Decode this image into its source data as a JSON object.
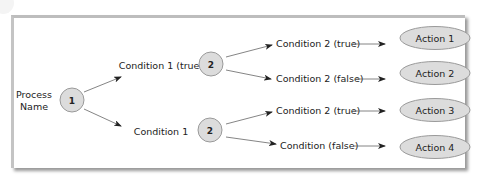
{
  "diagram": {
    "root": {
      "label_lines": [
        "Process",
        "Name"
      ],
      "step": "1"
    },
    "branches": [
      {
        "condition": "Condition 1 (true)",
        "step": "2",
        "outcomes": [
          {
            "condition": "Condition 2 (true)",
            "action": "Action 1"
          },
          {
            "condition": "Condition 2 (false)",
            "action": "Action 2"
          }
        ]
      },
      {
        "condition": "Condition 1",
        "step": "2",
        "outcomes": [
          {
            "condition": "Condition 2 (true)",
            "action": "Action 3"
          },
          {
            "condition": "Condition (false)",
            "action": "Action 4"
          }
        ]
      }
    ],
    "colors": {
      "node_fill": "#dcdcdc",
      "node_stroke": "#9a9a9a",
      "arrow": "#555555",
      "text": "#222222"
    }
  }
}
